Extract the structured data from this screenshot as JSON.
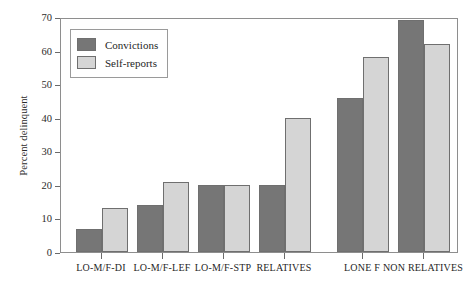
{
  "chart_data": {
    "type": "bar",
    "title": "",
    "subtitle": "",
    "xlabel": "",
    "ylabel": "Percent delinquent",
    "ylim": [
      0,
      70
    ],
    "ytick_labels": [
      "0",
      "10",
      "20",
      "30",
      "40",
      "50",
      "60",
      "70"
    ],
    "ytick_values": [
      0,
      10,
      20,
      30,
      40,
      50,
      60,
      70
    ],
    "grid": false,
    "legend_position": "top-left",
    "categories": [
      "LO-M/F-DI",
      "LO-M/F-LEF",
      "LO-M/F-STP",
      "RELATIVES",
      "LONE F",
      "NON RELATIVES"
    ],
    "series": [
      {
        "name": "Convictions",
        "color": "#767676",
        "values": [
          7,
          14,
          20,
          20,
          46,
          69
        ]
      },
      {
        "name": "Self-reports",
        "color": "#d5d5d5",
        "values": [
          13,
          21,
          20,
          40,
          58,
          62
        ]
      }
    ]
  },
  "legend": {
    "entries": [
      {
        "label": "Convictions",
        "color": "#767676"
      },
      {
        "label": "Self-reports",
        "color": "#d5d5d5"
      }
    ]
  },
  "axes": {
    "y_title": "Percent delinquent"
  },
  "colors": {
    "series_convictions": "#767676",
    "series_self_reports": "#d5d5d5",
    "frame": "#8e8e8e",
    "text": "#1f1f1f",
    "background": "#ffffff"
  }
}
